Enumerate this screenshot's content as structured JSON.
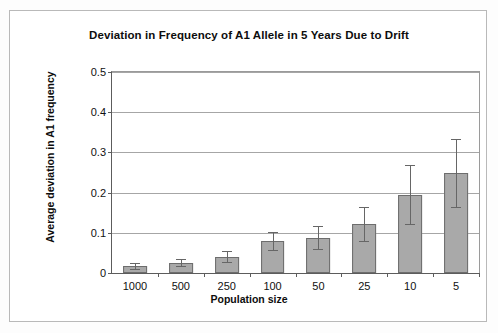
{
  "chart_data": {
    "type": "bar",
    "title": "Deviation in Frequency of A1 Allele in 5 Years Due to Drift",
    "xlabel": "Population size",
    "ylabel": "Average deviation in A1 frequency",
    "categories": [
      "1000",
      "500",
      "250",
      "100",
      "50",
      "25",
      "10",
      "5"
    ],
    "values": [
      0.017,
      0.026,
      0.04,
      0.079,
      0.088,
      0.122,
      0.195,
      0.25
    ],
    "error_low": [
      0.01,
      0.017,
      0.028,
      0.056,
      0.06,
      0.079,
      0.121,
      0.165
    ],
    "error_high": [
      0.026,
      0.036,
      0.054,
      0.103,
      0.117,
      0.165,
      0.268,
      0.334
    ],
    "ylim": [
      0,
      0.5
    ],
    "yticks": [
      "0",
      "0.1",
      "0.2",
      "0.3",
      "0.4",
      "0.5"
    ],
    "ytick_values": [
      0,
      0.1,
      0.2,
      0.3,
      0.4,
      0.5
    ],
    "grid": true,
    "legend": false,
    "bar_color": "#a9a9a9",
    "bar_border_color": "#6d6d6d",
    "error_color": "#666666",
    "grid_color": "#a6a6a6",
    "axis_color": "#5c5c5c",
    "text_color": "#0d0d0d",
    "background": "#ffffff"
  }
}
